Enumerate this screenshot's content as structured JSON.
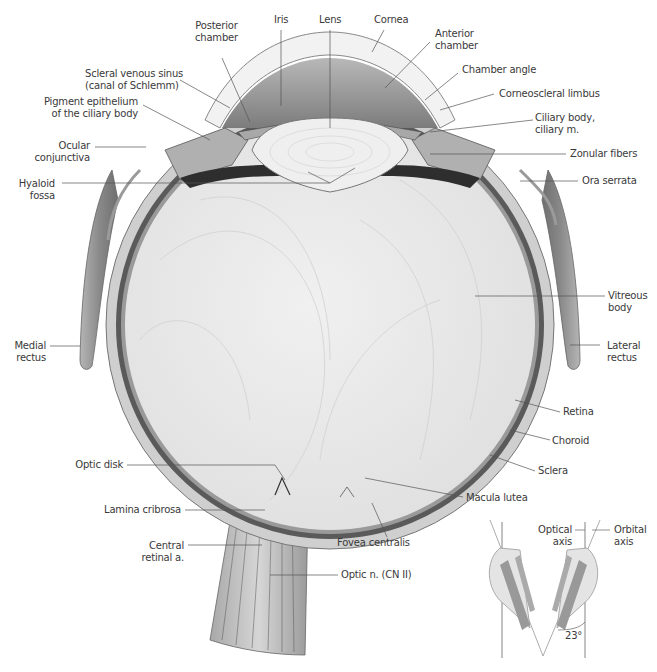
{
  "figure": {
    "colors": {
      "background": "#ffffff",
      "vitreous": "#e9e9e9",
      "sclera": "#cfcfcf",
      "choroid": "#5a5a5a",
      "retina": "#8a8a8a",
      "lens": "#eeeeee",
      "anterior_chamber": "#9a9a9a",
      "cornea": "#f2f2f2",
      "muscle": "#8f8f8f",
      "leader_line": "#555555",
      "label_text": "#3a3a3a"
    }
  },
  "labels": {
    "posterior_chamber": {
      "line1": "Posterior",
      "line2": "chamber"
    },
    "iris": {
      "line1": "Iris"
    },
    "lens": {
      "line1": "Lens"
    },
    "cornea": {
      "line1": "Cornea"
    },
    "anterior_chamber": {
      "line1": "Anterior",
      "line2": "chamber"
    },
    "scleral_venous_sinus": {
      "line1": "Scleral venous sinus",
      "line2": "(canal of Schlemm)"
    },
    "chamber_angle": {
      "line1": "Chamber angle"
    },
    "pigment_epithelium": {
      "line1": "Pigment epithelium",
      "line2": "of the ciliary body"
    },
    "corneoscleral_limbus": {
      "line1": "Corneoscleral limbus"
    },
    "ciliary_body": {
      "line1": "Ciliary body,",
      "line2": "ciliary m."
    },
    "ocular_conjunctiva": {
      "line1": "Ocular",
      "line2": "conjunctiva"
    },
    "zonular_fibers": {
      "line1": "Zonular fibers"
    },
    "hyaloid_fossa": {
      "line1": "Hyaloid",
      "line2": "fossa"
    },
    "ora_serrata": {
      "line1": "Ora serrata"
    },
    "vitreous_body": {
      "line1": "Vitreous",
      "line2": "body"
    },
    "medial_rectus": {
      "line1": "Medial",
      "line2": "rectus"
    },
    "lateral_rectus": {
      "line1": "Lateral",
      "line2": "rectus"
    },
    "retina": {
      "line1": "Retina"
    },
    "choroid": {
      "line1": "Choroid"
    },
    "sclera": {
      "line1": "Sclera"
    },
    "optic_disk": {
      "line1": "Optic disk"
    },
    "macula_lutea": {
      "line1": "Macula lutea"
    },
    "lamina_cribrosa": {
      "line1": "Lamina cribrosa"
    },
    "fovea_centralis": {
      "line1": "Fovea centralis"
    },
    "central_retinal_a": {
      "line1": "Central",
      "line2": "retinal a."
    },
    "optic_nerve": {
      "line1": "Optic n. (CN II)"
    }
  },
  "inset": {
    "optical_axis": {
      "line1": "Optical",
      "line2": "axis"
    },
    "orbital_axis": {
      "line1": "Orbital",
      "line2": "axis"
    },
    "angle": "23°"
  }
}
